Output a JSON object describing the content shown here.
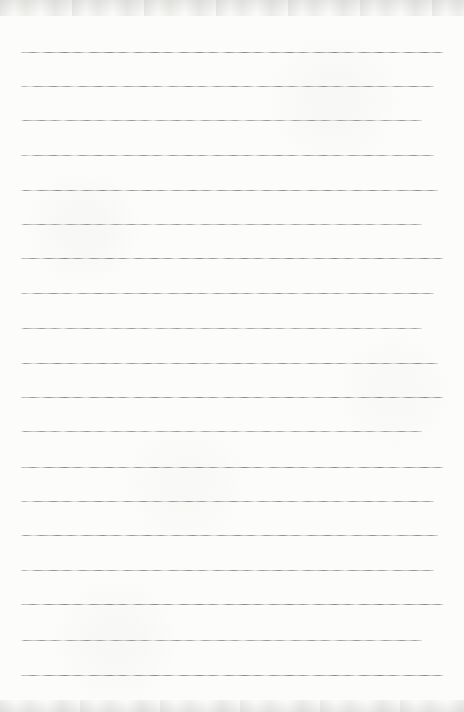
{
  "page": {
    "type": "scanned-blank-ruled-notebook-page",
    "width_px": 464,
    "height_px": 712,
    "text_content": "",
    "colors": {
      "paper": "#fcfcfa",
      "rule_line": "#787878",
      "scan_edge_shadow": "#969694"
    }
  },
  "ruling": {
    "line_count": 19,
    "line_left_x": 20,
    "line_right_x": 445,
    "average_spacing_px": 34.6,
    "line_y_positions": [
      52,
      86,
      120,
      155,
      190,
      224,
      258,
      293,
      328,
      363,
      397,
      431,
      467,
      501,
      535,
      570,
      604,
      640,
      675
    ]
  }
}
